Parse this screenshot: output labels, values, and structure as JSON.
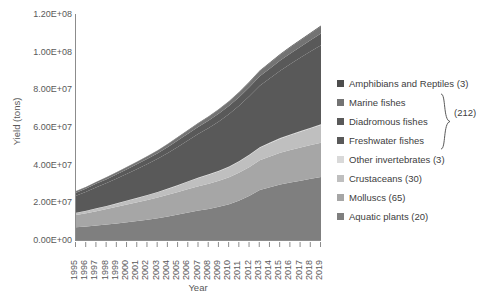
{
  "chart_data": {
    "type": "area",
    "stacked": true,
    "title": "",
    "xlabel": "Year",
    "ylabel": "Yield (tons)",
    "grid": false,
    "legend_position": "right",
    "ylim": [
      0,
      120000000
    ],
    "ytick_labels": [
      "0.00E+00",
      "2.00E+07",
      "4.00E+07",
      "6.00E+07",
      "8.00E+07",
      "1.00E+08",
      "1.20E+08"
    ],
    "ytick_values": [
      0,
      20000000,
      40000000,
      60000000,
      80000000,
      100000000,
      120000000
    ],
    "categories": [
      "1995",
      "1996",
      "1997",
      "1998",
      "1999",
      "2000",
      "2001",
      "2002",
      "2003",
      "2004",
      "2005",
      "2006",
      "2007",
      "2008",
      "2009",
      "2010",
      "2011",
      "2012",
      "2013",
      "2014",
      "2015",
      "2016",
      "2017",
      "2018",
      "2019"
    ],
    "series": [
      {
        "name": "Aquatic plants (20)",
        "color": "#7f7f7f",
        "values": [
          6800000,
          7200000,
          7700000,
          8200000,
          8800000,
          9400000,
          10100000,
          10800000,
          11600000,
          12500000,
          13500000,
          14600000,
          15600000,
          16500000,
          17600000,
          19000000,
          21000000,
          23500000,
          26500000,
          28000000,
          29500000,
          30500000,
          31500000,
          32500000,
          33500000
        ]
      },
      {
        "name": "Molluscs (65)",
        "color": "#a6a6a6",
        "values": [
          6500000,
          7000000,
          7600000,
          8200000,
          8800000,
          9500000,
          10000000,
          10500000,
          11000000,
          11500000,
          12000000,
          12500000,
          13000000,
          13400000,
          13800000,
          14300000,
          14800000,
          15300000,
          15800000,
          16300000,
          16800000,
          17300000,
          17600000,
          17900000,
          18200000
        ]
      },
      {
        "name": "Crustaceans (30)",
        "color": "#bfbfbf",
        "values": [
          1100000,
          1250000,
          1400000,
          1500000,
          1700000,
          1900000,
          2100000,
          2400000,
          2700000,
          3100000,
          3500000,
          3900000,
          4300000,
          4700000,
          5100000,
          5500000,
          5900000,
          6300000,
          6700000,
          7100000,
          7500000,
          7900000,
          8400000,
          8900000,
          9400000
        ]
      },
      {
        "name": "Other invertebrates (3)",
        "color": "#d9d9d9",
        "values": [
          130000,
          140000,
          150000,
          160000,
          170000,
          180000,
          190000,
          200000,
          210000,
          220000,
          230000,
          240000,
          250000,
          260000,
          270000,
          280000,
          290000,
          300000,
          310000,
          320000,
          330000,
          340000,
          350000,
          360000,
          370000
        ]
      },
      {
        "name": "Freshwater fishes",
        "color": "#595959",
        "values": [
          9000000,
          10000000,
          11200000,
          12200000,
          13200000,
          14200000,
          15300000,
          16400000,
          17600000,
          18900000,
          20300000,
          21700000,
          23200000,
          24600000,
          26200000,
          27800000,
          29400000,
          31000000,
          32600000,
          34200000,
          35800000,
          37400000,
          39000000,
          40500000,
          42000000
        ]
      },
      {
        "name": "Diadromous fishes",
        "color": "#595959",
        "values": [
          1600000,
          1750000,
          1900000,
          2050000,
          2200000,
          2400000,
          2600000,
          2800000,
          3000000,
          3200000,
          3400000,
          3600000,
          3800000,
          4000000,
          4200000,
          4400000,
          4600000,
          4800000,
          5000000,
          5200000,
          5400000,
          5600000,
          5800000,
          6000000,
          6200000
        ]
      },
      {
        "name": "Marine fishes",
        "color": "#737373",
        "values": [
          800000,
          860000,
          930000,
          1000000,
          1080000,
          1160000,
          1250000,
          1340000,
          1440000,
          1550000,
          1660000,
          1780000,
          1900000,
          2030000,
          2160000,
          2300000,
          2450000,
          2600000,
          2760000,
          2920000,
          3090000,
          3260000,
          3440000,
          3620000,
          3800000
        ]
      },
      {
        "name": "Amphibians and Reptiles (3)",
        "color": "#4d4d4d",
        "values": [
          60000,
          70000,
          80000,
          90000,
          100000,
          110000,
          120000,
          130000,
          145000,
          160000,
          175000,
          190000,
          205000,
          220000,
          240000,
          260000,
          280000,
          300000,
          320000,
          345000,
          370000,
          395000,
          420000,
          450000,
          480000
        ]
      }
    ]
  },
  "legend": {
    "items": [
      {
        "label": "Amphibians and Reptiles (3)",
        "color": "#4d4d4d"
      },
      {
        "label": "Marine fishes",
        "color": "#737373"
      },
      {
        "label": "Diadromous fishes",
        "color": "#595959"
      },
      {
        "label": "Freshwater fishes",
        "color": "#595959"
      },
      {
        "label": "Other invertebrates (3)",
        "color": "#d9d9d9"
      },
      {
        "label": "Crustaceans (30)",
        "color": "#bfbfbf"
      },
      {
        "label": "Molluscs (65)",
        "color": "#a6a6a6"
      },
      {
        "label": "Aquatic plants (20)",
        "color": "#7f7f7f"
      }
    ],
    "brace_label": "(212)"
  }
}
